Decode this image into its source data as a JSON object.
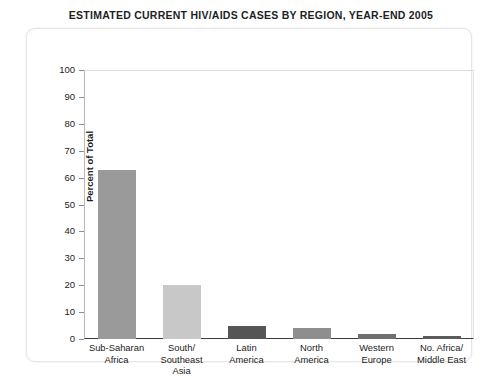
{
  "chart_data": {
    "type": "bar",
    "title": "ESTIMATED CURRENT HIV/AIDS CASES BY REGION, YEAR-END 2005",
    "xlabel": "",
    "ylabel": "Percent of Total",
    "ylim": [
      0,
      100
    ],
    "yticks": [
      100,
      90,
      80,
      70,
      60,
      50,
      40,
      30,
      20,
      10,
      0
    ],
    "grid": false,
    "legend": false,
    "categories": [
      "Sub-Saharan Africa",
      "South/ Southeast Asia",
      "Latin America",
      "North America",
      "Western Europe",
      "No. Africa/ Middle East"
    ],
    "category_lines": [
      [
        "Sub-Saharan",
        "Africa"
      ],
      [
        "South/",
        "Southeast",
        "Asia"
      ],
      [
        "Latin",
        "America"
      ],
      [
        "North",
        "America"
      ],
      [
        "Western",
        "Europe"
      ],
      [
        "No. Africa/",
        "Middle East"
      ]
    ],
    "values": [
      63,
      20,
      5,
      4,
      2,
      1
    ],
    "bar_colors": [
      "#9a9a9a",
      "#c8c8c8",
      "#555555",
      "#8e8e8e",
      "#6f6f6f",
      "#5c5c5c"
    ]
  },
  "colors": {
    "background": "#ffffff",
    "card": "#ffffff",
    "card_border": "#e6e6e6",
    "axis": "#3d3d3d",
    "text": "#1e1c1c"
  }
}
